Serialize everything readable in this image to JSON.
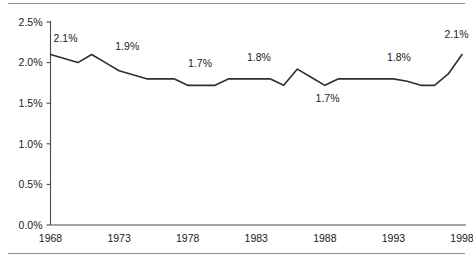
{
  "figure": {
    "name": "line-chart-figure",
    "top_rule_color": "#8e8e8e",
    "bottom_rule_color": "#8e8e8e"
  },
  "chart_data": {
    "type": "line",
    "title": "",
    "subtitle": "",
    "xlabel": "",
    "ylabel": "",
    "xlim": [
      1968,
      1998
    ],
    "ylim": [
      0.0,
      2.5
    ],
    "grid": false,
    "legend": false,
    "legend_position": "none",
    "line_color": "#2f2f2f",
    "axis_color": "#4a4a4a",
    "text_color": "#1a1a1a",
    "y_ticks": [
      0.0,
      0.5,
      1.0,
      1.5,
      2.0,
      2.5
    ],
    "y_tick_labels": [
      "0.0%",
      "0.5%",
      "1.0%",
      "1.5%",
      "2.0%",
      "2.5%"
    ],
    "x_ticks": [
      1968,
      1973,
      1978,
      1983,
      1988,
      1993,
      1998
    ],
    "x_tick_labels": [
      "1968",
      "1973",
      "1978",
      "1983",
      "1988",
      "1993",
      "1998"
    ],
    "series": [
      {
        "name": "rate",
        "x": [
          1968,
          1969,
          1970,
          1971,
          1972,
          1973,
          1974,
          1975,
          1976,
          1977,
          1978,
          1979,
          1980,
          1981,
          1982,
          1983,
          1984,
          1985,
          1986,
          1987,
          1988,
          1989,
          1990,
          1991,
          1992,
          1993,
          1994,
          1995,
          1996,
          1997,
          1998
        ],
        "values": [
          2.1,
          2.05,
          2.0,
          2.1,
          2.0,
          1.9,
          1.85,
          1.8,
          1.8,
          1.8,
          1.72,
          1.72,
          1.72,
          1.8,
          1.8,
          1.8,
          1.8,
          1.72,
          1.92,
          1.82,
          1.72,
          1.8,
          1.8,
          1.8,
          1.8,
          1.8,
          1.77,
          1.72,
          1.72,
          1.86,
          2.1
        ]
      }
    ],
    "annotations": [
      {
        "text": "2.1%",
        "x": 1969.1,
        "y": 2.25,
        "placement": "above"
      },
      {
        "text": "1.9%",
        "x": 1973.6,
        "y": 2.16,
        "placement": "above"
      },
      {
        "text": "1.7%",
        "x": 1978.9,
        "y": 1.95,
        "placement": "above"
      },
      {
        "text": "1.8%",
        "x": 1983.2,
        "y": 2.02,
        "placement": "above"
      },
      {
        "text": "1.7%",
        "x": 1988.2,
        "y": 1.52,
        "placement": "below"
      },
      {
        "text": "1.8%",
        "x": 1993.4,
        "y": 2.02,
        "placement": "above"
      },
      {
        "text": "2.1%",
        "x": 1997.6,
        "y": 2.3,
        "placement": "above"
      }
    ]
  }
}
